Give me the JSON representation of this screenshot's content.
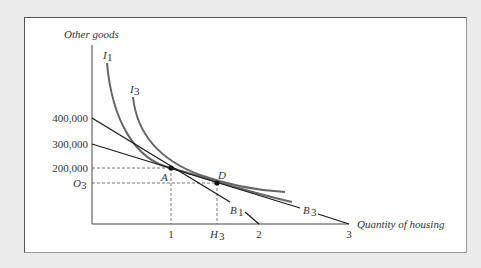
{
  "diagram": {
    "type": "indifference-curve-budget-line",
    "y_axis_label": "Other goods",
    "x_axis_label": "Quantity of housing",
    "y_ticks": [
      {
        "label": "400,000",
        "y": 118
      },
      {
        "label": "300,000",
        "y": 144
      },
      {
        "label": "200,000",
        "y": 168
      },
      {
        "label": "O",
        "sub": "3",
        "y": 183
      }
    ],
    "x_ticks": [
      {
        "label": "1",
        "x": 171
      },
      {
        "label": "H",
        "sub": "3",
        "x": 217
      },
      {
        "label": "2",
        "x": 259
      },
      {
        "label": "3",
        "x": 349
      }
    ],
    "curves": [
      {
        "name": "I",
        "sub": "1"
      },
      {
        "name": "I",
        "sub": "3"
      }
    ],
    "budget_lines": [
      {
        "name": "B",
        "sub": "1",
        "from": "400,000",
        "to": "2"
      },
      {
        "name": "B",
        "sub": "3",
        "from": "300,000",
        "to": "3"
      }
    ],
    "points": [
      {
        "name": "A",
        "housing": "1",
        "other_goods": "200,000"
      },
      {
        "name": "D",
        "housing": "H3",
        "other_goods": "O3"
      }
    ],
    "colors": {
      "background": "#ececec",
      "panel": "#ffffff",
      "budget_line": "#1a1a1a",
      "indifference_curve": "#666666",
      "text": "#333333"
    }
  }
}
